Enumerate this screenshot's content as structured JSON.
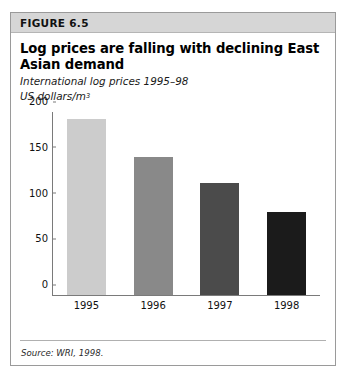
{
  "figure": {
    "label": "FIGURE 6.5",
    "title": "Log prices are falling with declining East Asian demand",
    "subtitle": "International log prices 1995–98",
    "units": "US dollars/m",
    "units_exponent": "3",
    "source": "Source: WRI, 1998."
  },
  "chart_data": {
    "type": "bar",
    "title": "Log prices are falling with declining East Asian demand",
    "subtitle": "International log prices 1995–98",
    "xlabel": "",
    "ylabel": "US dollars/m3",
    "categories": [
      "1995",
      "1996",
      "1997",
      "1998"
    ],
    "values": [
      192,
      151,
      123,
      91
    ],
    "ylim": [
      0,
      200
    ],
    "yticks": [
      0,
      50,
      100,
      150,
      200
    ],
    "ytick_labels": [
      "0",
      "50",
      "100",
      "150",
      "200"
    ],
    "grid": false,
    "legend": "none",
    "bar_colors": [
      "#cccccc",
      "#898989",
      "#4b4b4b",
      "#1b1b1b"
    ],
    "source": "Source: WRI, 1998."
  },
  "colors": {
    "band": "#d6d6d6",
    "frame": "#9a9a9a",
    "axis": "#7a7a7a"
  }
}
